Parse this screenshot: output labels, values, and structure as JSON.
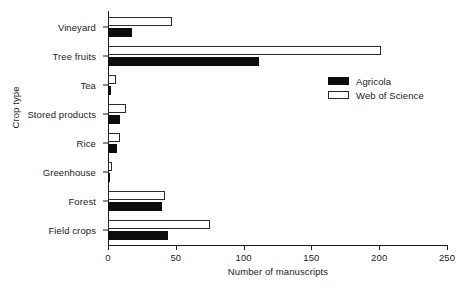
{
  "chart_data": {
    "type": "bar",
    "orientation": "horizontal",
    "title": "",
    "xlabel": "Number of manuscripts",
    "ylabel": "Crop type",
    "xlim": [
      0,
      250
    ],
    "xticks": [
      0,
      50,
      100,
      150,
      200,
      250
    ],
    "xticklabels": [
      "0",
      "50",
      "100",
      "150",
      "200",
      "250"
    ],
    "grid": false,
    "legend_position": "upper right",
    "categories": [
      "Vineyard",
      "Tree fruits",
      "Tea",
      "Stored products",
      "Rice",
      "Greenhouse",
      "Forest",
      "Field crops"
    ],
    "series": [
      {
        "name": "Agricola",
        "color": "#0d0d0d",
        "style": "filled",
        "values": [
          18,
          111,
          2,
          9,
          7,
          1,
          40,
          44
        ]
      },
      {
        "name": "Web of Science",
        "color": "#ffffff",
        "style": "outline",
        "values": [
          47,
          201,
          6,
          13,
          9,
          3,
          42,
          75
        ]
      }
    ]
  },
  "legend": {
    "entries": [
      {
        "label": "Agricola"
      },
      {
        "label": "Web of Science"
      }
    ]
  },
  "colors": {
    "agricola": "#0d0d0d",
    "web_of_science": "#ffffff",
    "axis": "#1a1a1a",
    "background": "#ffffff"
  }
}
